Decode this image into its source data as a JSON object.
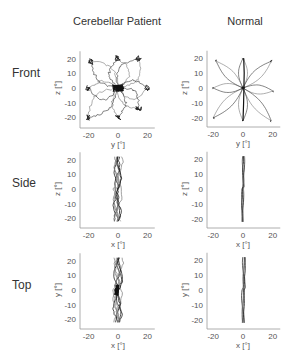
{
  "columns": [
    "Cerebellar Patient",
    "Normal"
  ],
  "rows": [
    "Front",
    "Side",
    "Top"
  ],
  "chart_data": [
    {
      "type": "line",
      "panel": "Front / Cerebellar Patient",
      "xlabel": "y [°]",
      "ylabel": "z [°]",
      "xlim": [
        -25,
        25
      ],
      "ylim": [
        -25,
        25
      ],
      "xticks": [
        -20,
        0,
        20
      ],
      "yticks": [
        20,
        10,
        0,
        -10,
        -20
      ],
      "description": "Eight noisy center-out saccade traces to targets at ±20° radius; dense cluster near origin",
      "targets": [
        [
          0,
          20
        ],
        [
          14,
          20
        ],
        [
          20,
          0
        ],
        [
          14,
          -14
        ],
        [
          0,
          -20
        ],
        [
          -20,
          -20
        ],
        [
          -20,
          0
        ],
        [
          -18,
          18
        ]
      ]
    },
    {
      "type": "line",
      "panel": "Front / Normal",
      "xlabel": "y [°]",
      "ylabel": "z [°]",
      "xlim": [
        -25,
        25
      ],
      "ylim": [
        -25,
        25
      ],
      "xticks": [
        -20,
        0,
        20
      ],
      "yticks": [
        20,
        10,
        0,
        -10,
        -20
      ],
      "description": "Eight smooth curved center-out traces to targets",
      "targets": [
        [
          0,
          20
        ],
        [
          19,
          18
        ],
        [
          20,
          -2
        ],
        [
          19,
          -22
        ],
        [
          0,
          -22
        ],
        [
          -20,
          -20
        ],
        [
          -20,
          0
        ],
        [
          -18,
          18
        ]
      ]
    },
    {
      "type": "line",
      "panel": "Side / Cerebellar Patient",
      "xlabel": "x [°]",
      "ylabel": "z [°]",
      "xlim": [
        -25,
        25
      ],
      "ylim": [
        -25,
        25
      ],
      "xticks": [
        -20,
        0,
        20
      ],
      "yticks": [
        20,
        10,
        0,
        -10,
        -20
      ],
      "description": "Near-vertical band of traces, x within about -4..3, z from -22 to 22"
    },
    {
      "type": "line",
      "panel": "Side / Normal",
      "xlabel": "x [°]",
      "ylabel": "z [°]",
      "xlim": [
        -25,
        25
      ],
      "ylim": [
        -25,
        25
      ],
      "xticks": [
        -20,
        0,
        20
      ],
      "yticks": [
        20,
        10,
        0,
        -10,
        -20
      ],
      "description": "Narrow vertical band, x within about -1..2, z from -22 to 20"
    },
    {
      "type": "line",
      "panel": "Top / Cerebellar Patient",
      "xlabel": "x [°]",
      "ylabel": "y [°]",
      "xlim": [
        -25,
        25
      ],
      "ylim": [
        -25,
        25
      ],
      "xticks": [
        -20,
        0,
        20
      ],
      "yticks": [
        20,
        10,
        0,
        -10,
        -20
      ],
      "description": "Vertical band of traces, x about -4..3, y from -22 to 22, dense near origin"
    },
    {
      "type": "line",
      "panel": "Top / Normal",
      "xlabel": "x [°]",
      "ylabel": "y [°]",
      "xlim": [
        -25,
        25
      ],
      "ylim": [
        -25,
        25
      ],
      "xticks": [
        -20,
        0,
        20
      ],
      "yticks": [
        20,
        10,
        0,
        -10,
        -20
      ],
      "description": "Narrow vertical band, x about -1..2, y from -21 to 19"
    }
  ],
  "ticks": {
    "x": [
      "-20",
      "0",
      "20"
    ],
    "y": [
      "20",
      "10",
      "0",
      "-10",
      "-20"
    ]
  },
  "labels": {
    "front_x": "y [°]",
    "front_y": "z [°]",
    "side_x": "x [°]",
    "side_y": "z [°]",
    "top_x": "x [°]",
    "top_y": "y [°]"
  }
}
